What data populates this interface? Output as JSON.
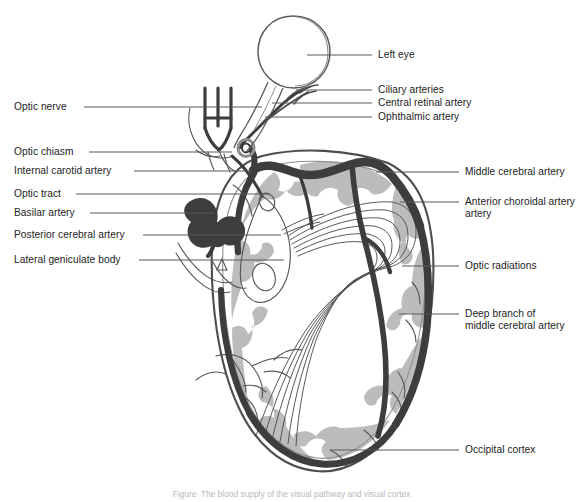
{
  "figure": {
    "title": "Blood supply of the visual pathway",
    "caption": "Figure  The blood supply of the visual pathway and visual cortex"
  },
  "colors": {
    "artery_dark": "#3f3f3f",
    "cortex_gray": "#b9b9b9",
    "outline": "#4d4d4d",
    "leader_line": "#58585a",
    "text": "#1c1c1c",
    "background": "#ffffff"
  },
  "labels_left": [
    {
      "id": "optic-nerve",
      "text": "Optic nerve",
      "x": 14,
      "y": 101,
      "line_x1": 84,
      "line_x2": 262,
      "line_y": 107
    },
    {
      "id": "optic-chiasm",
      "text": "Optic chiasm",
      "x": 14,
      "y": 146,
      "line_x1": 89,
      "line_x2": 232,
      "line_y": 152
    },
    {
      "id": "internal-carotid-artery",
      "text": "Internal carotid artery",
      "x": 14,
      "y": 165,
      "line_x1": 134,
      "line_x2": 252,
      "line_y": 171
    },
    {
      "id": "optic-tract",
      "text": "Optic tract",
      "x": 14,
      "y": 188,
      "line_x1": 76,
      "line_x2": 270,
      "line_y": 194
    },
    {
      "id": "basilar-artery",
      "text": "Basilar artery",
      "x": 14,
      "y": 207,
      "line_x1": 90,
      "line_x2": 215,
      "line_y": 213
    },
    {
      "id": "posterior-cerebral-artery",
      "text": "Posterior cerebral artery",
      "x": 14,
      "y": 229,
      "line_x1": 143,
      "line_x2": 281,
      "line_y": 235
    },
    {
      "id": "lateral-geniculate-body",
      "text": "Lateral geniculate body",
      "x": 14,
      "y": 254,
      "line_x1": 139,
      "line_x2": 284,
      "line_y": 260
    }
  ],
  "labels_right": [
    {
      "id": "left-eye",
      "text": "Left eye",
      "x": 378,
      "y": 49,
      "line_x1": 307,
      "line_x2": 372,
      "line_y": 55
    },
    {
      "id": "ciliary-arteries",
      "text": "Ciliary arteries",
      "x": 378,
      "y": 84,
      "line_x1": 296,
      "line_x2": 372,
      "line_y": 90
    },
    {
      "id": "central-retinal-artery",
      "text": "Central retinal artery",
      "x": 378,
      "y": 97,
      "line_x1": 272,
      "line_x2": 372,
      "line_y": 103
    },
    {
      "id": "ophthalmic-artery",
      "text": "Ophthalmic artery",
      "x": 378,
      "y": 111,
      "line_x1": 265,
      "line_x2": 372,
      "line_y": 117
    },
    {
      "id": "middle-cerebral-artery",
      "text": "Middle cerebral artery",
      "x": 465,
      "y": 166,
      "line_x1": 376,
      "line_x2": 459,
      "line_y": 172
    },
    {
      "id": "anterior-choroidal-artery",
      "text": "Anterior choroidal artery\nartery",
      "x": 465,
      "y": 196,
      "line_x1": 400,
      "line_x2": 459,
      "line_y": 202
    },
    {
      "id": "optic-radiations",
      "text": "Optic radiations",
      "x": 465,
      "y": 260,
      "line_x1": 402,
      "line_x2": 459,
      "line_y": 266
    },
    {
      "id": "deep-branch-mca",
      "text": "Deep branch of\nmiddle cerebral artery",
      "x": 465,
      "y": 308,
      "line_x1": 399,
      "line_x2": 459,
      "line_y": 314
    },
    {
      "id": "occipital-cortex",
      "text": "Occipital cortex",
      "x": 465,
      "y": 444,
      "line_x1": 330,
      "line_x2": 459,
      "line_y": 450
    }
  ],
  "label_text_overrides": {
    "anterior-choroidal-artery_line1": "Anterior choroidal",
    "anterior-choroidal-artery_line2": "artery",
    "deep-branch-mca_line1": "Deep branch of",
    "deep-branch-mca_line2": "middle cerebral artery"
  },
  "anatomy_parts": [
    "eye-globe",
    "optic-nerve-trunk",
    "optic-chiasm",
    "optic-tract",
    "internal-carotid-artery",
    "middle-cerebral-artery",
    "anterior-choroidal-artery",
    "basilar-artery",
    "posterior-cerebral-artery",
    "lateral-geniculate-body",
    "optic-radiations",
    "occipital-cortex",
    "cerebral-hemisphere-outline"
  ]
}
